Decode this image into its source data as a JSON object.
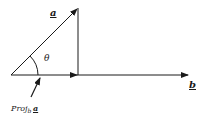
{
  "diagram": {
    "labels": {
      "vector_a": "a",
      "vector_b": "b",
      "angle": "θ",
      "projection_prefix": "Proj",
      "projection_sub": "b",
      "projection_vec": "a"
    },
    "colors": {
      "stroke": "#1a1a1a",
      "background": "#ffffff"
    }
  }
}
